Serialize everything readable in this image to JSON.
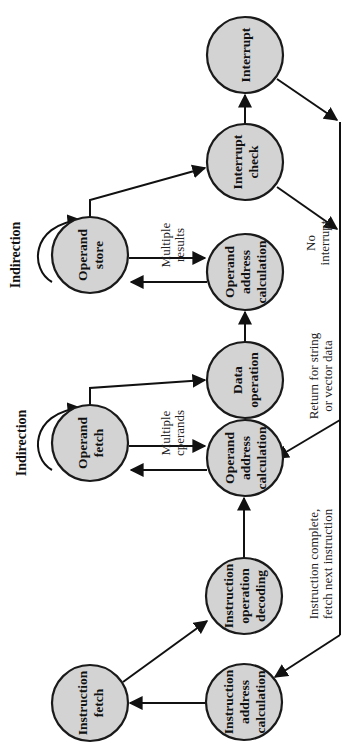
{
  "diagram": {
    "orientation": "rotated -90deg",
    "colors": {
      "node_fill": "#d3d3d3",
      "stroke": "#111111",
      "background": "#ffffff"
    },
    "nodes": [
      {
        "id": "interrupt",
        "lines": [
          "Interrupt"
        ]
      },
      {
        "id": "interrupt_check",
        "lines": [
          "Interrupt",
          "check"
        ]
      },
      {
        "id": "operand_store",
        "lines": [
          "Operand",
          "store"
        ]
      },
      {
        "id": "oac_store",
        "lines": [
          "Operand",
          "address",
          "calculation"
        ]
      },
      {
        "id": "data_operation",
        "lines": [
          "Data",
          "operation"
        ]
      },
      {
        "id": "operand_fetch",
        "lines": [
          "Operand",
          "fetch"
        ]
      },
      {
        "id": "oac_fetch",
        "lines": [
          "Operand",
          "address",
          "calculation"
        ]
      },
      {
        "id": "instr_decode",
        "lines": [
          "Instruction",
          "operation",
          "decoding"
        ]
      },
      {
        "id": "instr_fetch",
        "lines": [
          "Instruction",
          "fetch"
        ]
      },
      {
        "id": "instr_addr_calc",
        "lines": [
          "Instruction",
          "address",
          "calculation"
        ]
      }
    ],
    "labels": {
      "indirection_store": "Indirection",
      "indirection_fetch": "Indirection",
      "multiple_results": [
        "Multiple",
        "results"
      ],
      "multiple_operands": [
        "Multiple",
        "cperands"
      ],
      "no_interrupt": [
        "No",
        "interrupt"
      ],
      "return_string": [
        "Return for string",
        "or vector data"
      ],
      "instruction_complete": [
        "Instruction complete,",
        "fetch next instruction"
      ]
    },
    "edges": [
      [
        "instr_addr_calc",
        "instr_fetch"
      ],
      [
        "instr_fetch",
        "instr_decode"
      ],
      [
        "instr_decode",
        "oac_fetch"
      ],
      [
        "oac_fetch",
        "operand_fetch"
      ],
      [
        "operand_fetch",
        "oac_fetch",
        "Multiple operands"
      ],
      [
        "operand_fetch",
        "operand_fetch",
        "Indirection"
      ],
      [
        "operand_fetch",
        "data_operation"
      ],
      [
        "data_operation",
        "oac_store"
      ],
      [
        "oac_store",
        "operand_store"
      ],
      [
        "operand_store",
        "oac_store",
        "Multiple results"
      ],
      [
        "operand_store",
        "operand_store",
        "Indirection"
      ],
      [
        "operand_store",
        "interrupt_check"
      ],
      [
        "interrupt_check",
        "interrupt"
      ],
      [
        "interrupt_check",
        "instr_addr_calc",
        "No interrupt"
      ],
      [
        "interrupt",
        "instr_addr_calc"
      ],
      [
        "bus",
        "oac_fetch",
        "Return for string or vector data"
      ],
      [
        "bus",
        "instr_addr_calc",
        "Instruction complete, fetch next instruction"
      ]
    ]
  }
}
